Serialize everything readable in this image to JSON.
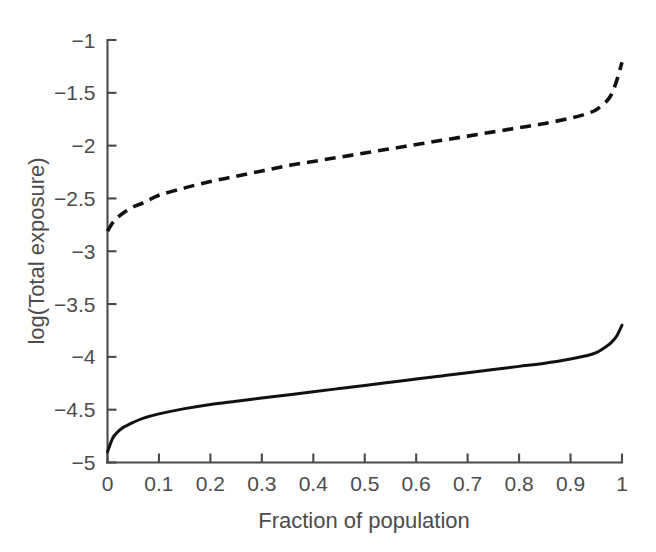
{
  "chart_data": {
    "type": "line",
    "title": "",
    "subtitle": "",
    "xlabel": "Fraction of population",
    "ylabel": "log(Total exposure)",
    "xlim": [
      0,
      1
    ],
    "ylim": [
      -5,
      -1
    ],
    "grid": false,
    "legend": null,
    "legend_position": "none",
    "xticks": [
      0,
      0.1,
      0.2,
      0.3,
      0.4,
      0.5,
      0.6,
      0.7,
      0.8,
      0.9,
      1
    ],
    "xticklabels": [
      "0",
      "0.1",
      "0.2",
      "0.3",
      "0.4",
      "0.5",
      "0.6",
      "0.7",
      "0.8",
      "0.9",
      "1"
    ],
    "yticks": [
      -1,
      -1.5,
      -2,
      -2.5,
      -3,
      -3.5,
      -4,
      -4.5,
      -5
    ],
    "yticklabels": [
      "−1",
      "−1.5",
      "−2",
      "−2.5",
      "−3",
      "−3.5",
      "−4",
      "−4.5",
      "−5"
    ],
    "x": [
      0,
      0.01,
      0.02,
      0.03,
      0.05,
      0.07,
      0.1,
      0.15,
      0.2,
      0.25,
      0.3,
      0.35,
      0.4,
      0.45,
      0.5,
      0.55,
      0.6,
      0.65,
      0.7,
      0.75,
      0.8,
      0.85,
      0.9,
      0.93,
      0.95,
      0.97,
      0.98,
      0.99,
      1
    ],
    "series": [
      {
        "name": "dashed-curve",
        "style": "dashed",
        "color": "#111111",
        "values": [
          -2.81,
          -2.73,
          -2.68,
          -2.64,
          -2.58,
          -2.54,
          -2.47,
          -2.4,
          -2.34,
          -2.29,
          -2.24,
          -2.19,
          -2.15,
          -2.11,
          -2.07,
          -2.03,
          -1.99,
          -1.95,
          -1.91,
          -1.87,
          -1.83,
          -1.79,
          -1.74,
          -1.7,
          -1.66,
          -1.58,
          -1.51,
          -1.38,
          -1.21
        ]
      },
      {
        "name": "solid-curve",
        "style": "solid",
        "color": "#111111",
        "values": [
          -4.9,
          -4.77,
          -4.71,
          -4.67,
          -4.62,
          -4.58,
          -4.54,
          -4.49,
          -4.45,
          -4.42,
          -4.39,
          -4.36,
          -4.33,
          -4.3,
          -4.27,
          -4.24,
          -4.21,
          -4.18,
          -4.15,
          -4.12,
          -4.09,
          -4.06,
          -4.02,
          -3.99,
          -3.96,
          -3.9,
          -3.86,
          -3.8,
          -3.7
        ]
      }
    ],
    "annotations": []
  },
  "figure": {
    "background_color": "#ffffff",
    "axis_color": "#4a4a4a",
    "text_color": "#4c4c4c"
  }
}
